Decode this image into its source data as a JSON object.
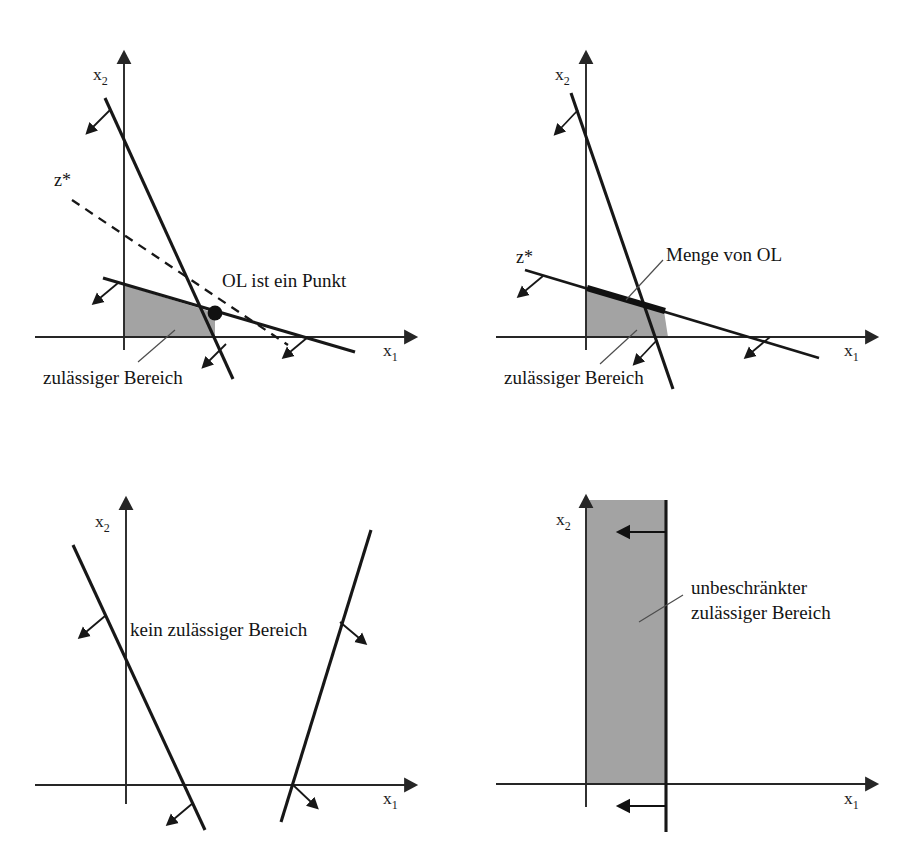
{
  "figure": {
    "background_color": "#ffffff",
    "feasible_fill_color": "#a3a3a3",
    "line_color": "#171717",
    "panel_count": 4
  },
  "labels": {
    "x_axis": "x",
    "x_axis_sub": "1",
    "y_axis": "x",
    "y_axis_sub": "2",
    "z_star": "z*"
  },
  "panels": [
    {
      "id": "panel-unique-optimum",
      "position": "top-left",
      "axis_x_label": "x",
      "axis_x_sub": "1",
      "axis_y_label": "x",
      "axis_y_sub": "2",
      "objective_label": "z*",
      "annotations": [
        {
          "name": "optimum-label",
          "text": "OL ist ein Punkt"
        },
        {
          "name": "feasible-region-label",
          "text": "zulässiger Bereich"
        }
      ],
      "has_objective_line": true,
      "has_vertex_dot": true,
      "constraint_count": 2
    },
    {
      "id": "panel-multiple-optima",
      "position": "top-right",
      "axis_x_label": "x",
      "axis_x_sub": "1",
      "axis_y_label": "x",
      "axis_y_sub": "2",
      "objective_label": "z*",
      "annotations": [
        {
          "name": "optimum-set-label",
          "text": "Menge von OL"
        },
        {
          "name": "feasible-region-label",
          "text": "zulässiger Bereich"
        }
      ],
      "has_objective_line": true,
      "has_optimal_segment": true,
      "constraint_count": 2
    },
    {
      "id": "panel-infeasible",
      "position": "bottom-left",
      "axis_x_label": "x",
      "axis_x_sub": "1",
      "axis_y_label": "x",
      "axis_y_sub": "2",
      "annotations": [
        {
          "name": "no-feasible-region-label",
          "text": "kein zulässiger Bereich"
        }
      ],
      "has_objective_line": false,
      "constraint_count": 2
    },
    {
      "id": "panel-unbounded",
      "position": "bottom-right",
      "axis_x_label": "x",
      "axis_x_sub": "1",
      "axis_y_label": "x",
      "axis_y_sub": "2",
      "annotations": [
        {
          "name": "unbounded-region-label-line1",
          "text": "unbeschränkter"
        },
        {
          "name": "unbounded-region-label-line2",
          "text": "zulässiger Bereich"
        }
      ],
      "has_objective_line": false,
      "constraint_count": 1
    }
  ]
}
